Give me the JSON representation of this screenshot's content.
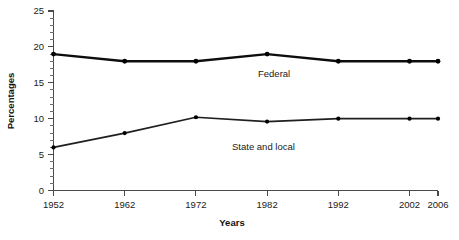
{
  "chart_data": {
    "type": "line",
    "title": "",
    "xlabel": "Years",
    "ylabel": "Percentages",
    "x": [
      1952,
      1962,
      1972,
      1982,
      1992,
      2002,
      2006
    ],
    "xtick_labels": [
      "1952",
      "1962",
      "1972",
      "1982",
      "1992",
      "2002",
      "2006"
    ],
    "ytick_labels": [
      "0",
      "5",
      "10",
      "15",
      "20",
      "25"
    ],
    "yticks": [
      0,
      5,
      10,
      15,
      20,
      25
    ],
    "ylim": [
      0,
      25
    ],
    "xlim": [
      1952,
      2006
    ],
    "y_minor_tick_step": 1,
    "grid": false,
    "legend_position": "inline-annotation",
    "series": [
      {
        "name": "Federal",
        "label": "Federal",
        "color": "#0d0d0d",
        "marker": "circle",
        "values": [
          19.0,
          18.0,
          18.0,
          19.0,
          18.0,
          18.0,
          18.0
        ]
      },
      {
        "name": "State and local",
        "label": "State and local",
        "color": "#1f1f1f",
        "marker": "circle",
        "values": [
          6.0,
          8.0,
          10.2,
          9.6,
          10.0,
          10.0,
          10.0
        ]
      }
    ],
    "annotations": [
      {
        "text": "Federal",
        "x": 1982,
        "y": 17.0
      },
      {
        "text": "State and local",
        "x": 1980,
        "y": 7.6
      }
    ]
  },
  "axes": {
    "y_title": "Percentages",
    "x_title": "Years"
  }
}
